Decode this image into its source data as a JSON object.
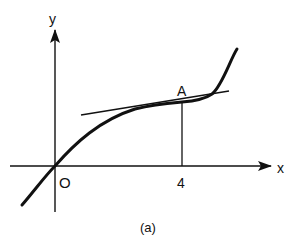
{
  "figure": {
    "caption": "(a)",
    "axes": {
      "x_label": "x",
      "y_label": "y",
      "origin_label": "O",
      "x_tick_label": "4"
    },
    "point": {
      "label": "A",
      "x_value": 4
    },
    "elements": [
      "y-axis with arrow",
      "x-axis with arrow",
      "curve through origin with inflection near A",
      "tangent line at A",
      "vertical dropline from A to x-axis at x=4"
    ],
    "colors": {
      "ink": "#111111",
      "background": "#ffffff"
    }
  }
}
